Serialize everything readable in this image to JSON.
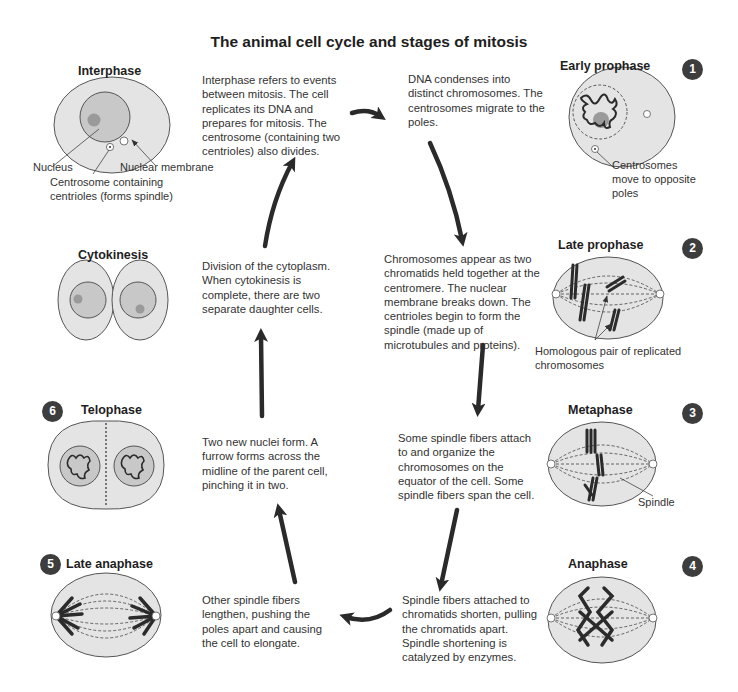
{
  "title": "The animal cell cycle and stages of mitosis",
  "colors": {
    "cytoplasm": "#e4e4e4",
    "nucleus": "#c8c8c8",
    "nucleolus": "#9a9a9a",
    "outline": "#555555",
    "chromosome": "#2b2b2b",
    "arrow": "#2a2a2a",
    "badge": "#3d3d3d"
  },
  "stages": [
    {
      "id": "interphase",
      "title": "Interphase",
      "number": "",
      "description": "Interphase refers to events between mitosis. The cell replicates its DNA and prepares for mitosis. The centrosome (containing two centrioles) also divides.",
      "labels": [
        "Nucleus",
        "Nuclear membrane",
        "Centrosome containing centrioles (forms spindle)"
      ]
    },
    {
      "id": "early-prophase",
      "title": "Early prophase",
      "number": "1",
      "description": "DNA condenses into distinct chromosomes. The centrosomes migrate to the poles.",
      "labels": [
        "Centrosomes move to opposite poles"
      ]
    },
    {
      "id": "late-prophase",
      "title": "Late prophase",
      "number": "2",
      "description": "Chromosomes appear as two chromatids held together at the centromere. The nuclear membrane breaks down. The centrioles begin to form the spindle (made up of microtubules and proteins).",
      "labels": [
        "Homologous pair of replicated chromosomes"
      ]
    },
    {
      "id": "metaphase",
      "title": "Metaphase",
      "number": "3",
      "description": "Some spindle fibers attach to and organize the chromosomes on the equator of the cell. Some spindle fibers span the cell.",
      "labels": [
        "Spindle"
      ]
    },
    {
      "id": "anaphase",
      "title": "Anaphase",
      "number": "4",
      "description": "Spindle fibers attached to chromatids shorten, pulling the chromatids apart. Spindle shortening is catalyzed by enzymes.",
      "labels": []
    },
    {
      "id": "late-anaphase",
      "title": "Late anaphase",
      "number": "5",
      "description": "Other spindle fibers lengthen, pushing the poles apart and causing the cell to elongate.",
      "labels": []
    },
    {
      "id": "telophase",
      "title": "Telophase",
      "number": "6",
      "description": "Two new nuclei form. A furrow forms across the midline of the parent cell, pinching it in two.",
      "labels": []
    },
    {
      "id": "cytokinesis",
      "title": "Cytokinesis",
      "number": "",
      "description": "Division of the cytoplasm. When cytokinesis is complete, there are two separate daughter cells.",
      "labels": []
    }
  ],
  "cycle_order": [
    "Interphase",
    "Early prophase",
    "Late prophase",
    "Metaphase",
    "Anaphase",
    "Late anaphase",
    "Telophase",
    "Cytokinesis"
  ]
}
